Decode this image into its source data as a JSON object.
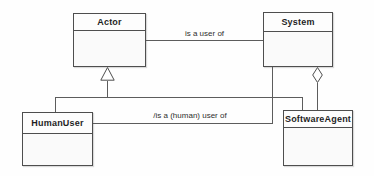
{
  "diagram": {
    "kind": "uml-class-diagram",
    "classes": [
      {
        "name": "Actor"
      },
      {
        "name": "System"
      },
      {
        "name": "HumanUser"
      },
      {
        "name": "SoftwareAgent"
      }
    ],
    "relations": [
      {
        "type": "association",
        "from": "Actor",
        "to": "System",
        "label": "is a user of"
      },
      {
        "type": "generalization",
        "from": "HumanUser",
        "to": "Actor",
        "label": ""
      },
      {
        "type": "generalization",
        "from": "SoftwareAgent",
        "to": "Actor",
        "label": ""
      },
      {
        "type": "derived-association",
        "from": "HumanUser",
        "to": "System",
        "label": "/is a (human) user of"
      },
      {
        "type": "aggregation",
        "whole": "System",
        "part": "SoftwareAgent",
        "label": ""
      }
    ],
    "colors": {
      "line": "#5c5c5c",
      "border": "#4e4e4e",
      "text": "#1f1f1f",
      "background": "#fefefe",
      "box_fill": "#fdfdfd"
    }
  }
}
